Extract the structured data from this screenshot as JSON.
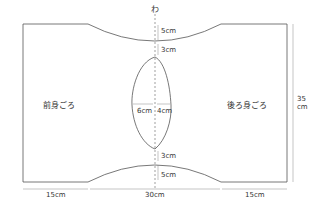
{
  "diagram": {
    "fold_mark": "わ",
    "front_label": "前身ごろ",
    "back_label": "後ろ身ごろ",
    "dims": {
      "top_neck_depth": "5cm",
      "top_gap": "3cm",
      "bottom_gap": "3cm",
      "bottom_neck_depth": "5cm",
      "hole_left": "6cm",
      "hole_right": "4cm",
      "left_width": "15cm",
      "center_width": "30cm",
      "right_width": "15cm",
      "height_num": "35",
      "height_unit": "cm"
    },
    "colors": {
      "line": "#555555",
      "dim": "#888888",
      "text": "#333333"
    }
  }
}
